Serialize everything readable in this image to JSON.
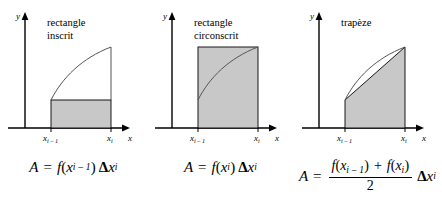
{
  "figure": {
    "background_color": "#ffffff",
    "stroke_color": "#000000",
    "fill_color": "#c8c8c8",
    "curve_color": "#555555"
  },
  "panels": [
    {
      "id": "rectangle-inscrit",
      "title_lines": [
        "rectangle",
        "inscrit"
      ],
      "axis": {
        "x_label": "x",
        "y_label": "y"
      },
      "ticks": [
        {
          "base": "x",
          "sub": "i – 1"
        },
        {
          "base": "x",
          "sub": "i"
        }
      ],
      "formula": {
        "lhs": "A",
        "equals": "=",
        "f": "f",
        "open": "(",
        "arg_base": "x",
        "arg_sub": "i – 1",
        "close": ")",
        "delta": "Δ",
        "dx_base": "x",
        "dx_sub": "i",
        "plain": "A = f(x i–1) Δx i"
      }
    },
    {
      "id": "rectangle-circonscrit",
      "title_lines": [
        "rectangle",
        "circonscrit"
      ],
      "axis": {
        "x_label": "x",
        "y_label": "y"
      },
      "ticks": [
        {
          "base": "x",
          "sub": "i – 1"
        },
        {
          "base": "x",
          "sub": "i"
        }
      ],
      "formula": {
        "lhs": "A",
        "equals": "=",
        "f": "f",
        "open": "(",
        "arg_base": "x",
        "arg_sub": "i",
        "close": ")",
        "delta": "Δ",
        "dx_base": "x",
        "dx_sub": "i",
        "plain": "A = f(x i) Δx i"
      }
    },
    {
      "id": "trapeze",
      "title_lines": [
        "trapèze"
      ],
      "axis": {
        "x_label": "x",
        "y_label": "y"
      },
      "ticks": [
        {
          "base": "x",
          "sub": "i – 1"
        },
        {
          "base": "x",
          "sub": "i"
        }
      ],
      "formula": {
        "lhs": "A",
        "equals": "=",
        "num_f1": "f",
        "num_open1": "(",
        "num_arg1_base": "x",
        "num_arg1_sub": "i – 1",
        "num_close1": ")",
        "plus": "+",
        "num_f2": "f",
        "num_open2": "(",
        "num_arg2_base": "x",
        "num_arg2_sub": "i",
        "num_close2": ")",
        "denominator": "2",
        "delta": "Δ",
        "dx_base": "x",
        "dx_sub": "i",
        "plain": "A = (f(x i–1) + f(x i)) / 2 · Δx i"
      }
    }
  ]
}
